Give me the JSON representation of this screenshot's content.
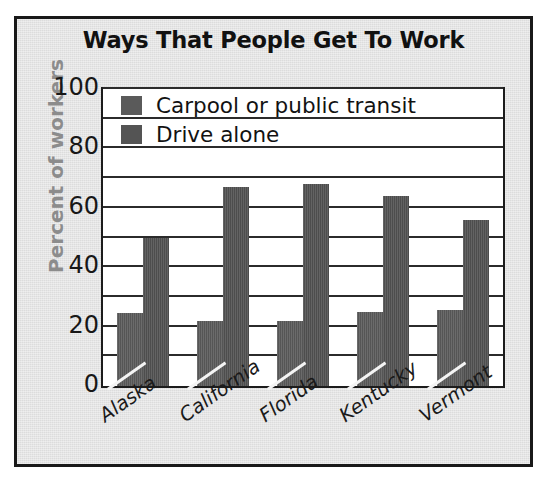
{
  "chart_data": {
    "type": "bar",
    "title": "Ways That People Get To Work",
    "xlabel": "",
    "ylabel": "Percent of workers",
    "ylim": [
      0,
      100
    ],
    "yticks": [
      100,
      80,
      60,
      40,
      20,
      0
    ],
    "grid": true,
    "gridline_interval": 10,
    "legend_position": "top-center-inside",
    "categories": [
      "Alaska",
      "California",
      "Florida",
      "Kentucky",
      "Vermont"
    ],
    "series": [
      {
        "name": "Carpool or public transit",
        "color": "#5a5a5a",
        "values": [
          24.5,
          22,
          22,
          25,
          25.5
        ]
      },
      {
        "name": "Drive alone",
        "color": "#515151",
        "values": [
          50,
          67,
          68,
          64,
          56
        ]
      }
    ]
  },
  "figure": {
    "panel_color": "#dcdcdc",
    "border_color": "#191919",
    "plot_bg": "#ffffff",
    "axis_color": "#1c1c1c",
    "ylabel_color": "#8c8c8c",
    "title_color": "#111111"
  }
}
